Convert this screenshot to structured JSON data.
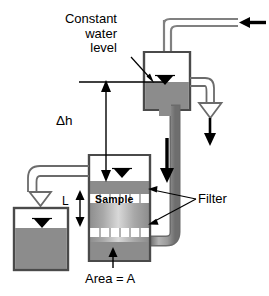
{
  "diagram": {
    "labels": {
      "constant_line1": "Constant",
      "constant_line2": "water",
      "constant_line3": "level",
      "head_difference": "Δh",
      "sample_length": "L",
      "sample": "Sample",
      "filter": "Filter",
      "area": "Area = A"
    },
    "colors": {
      "water_fill": "#8c8c8c",
      "sample_fill": "#9a9a9a",
      "pipe_fill": "#9e9e9e",
      "pipe_edge": "#6b6b6b",
      "outline": "#4a4a4a",
      "ink": "#000000",
      "background": "#ffffff"
    },
    "parts": [
      {
        "name": "inlet-pipe",
        "label": "",
        "flow": "in",
        "arrow": "solid-left"
      },
      {
        "name": "constant-head-tank",
        "label": "",
        "water": true
      },
      {
        "name": "overflow-pipe",
        "label": "",
        "flow": "out",
        "arrow": "hollow-down"
      },
      {
        "name": "overflow-drop-arrow",
        "label": "",
        "arrow": "solid-down"
      },
      {
        "name": "supply-downpipe",
        "label": "",
        "arrow": "solid-down"
      },
      {
        "name": "sample-cell",
        "label": "Sample",
        "water": true
      },
      {
        "name": "upper-filter-band",
        "label": "Filter",
        "segments": 6
      },
      {
        "name": "lower-filter-band",
        "label": "Filter",
        "segments": 6
      },
      {
        "name": "outflow-pipe",
        "label": "",
        "flow": "out",
        "arrow": "hollow-down"
      },
      {
        "name": "collection-beaker",
        "label": "",
        "water": true
      },
      {
        "name": "head-difference-dimension",
        "label": "Δh",
        "arrow": "double-vertical"
      },
      {
        "name": "sample-length-dimension",
        "label": "L",
        "arrow": "double-vertical"
      },
      {
        "name": "area-callout",
        "label": "Area = A",
        "arrow": "solid-up"
      },
      {
        "name": "constant-level-callout",
        "label": "Constant water level",
        "arrow": "leader"
      }
    ],
    "water_level_symbol": "▼"
  }
}
